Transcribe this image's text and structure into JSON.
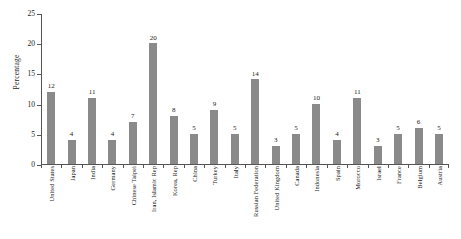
{
  "chart_data": {
    "type": "bar",
    "title": "",
    "subtitle": "",
    "xlabel": "",
    "ylabel": "Percentage",
    "ylim": [
      0,
      25
    ],
    "yticks": [
      0,
      5,
      10,
      15,
      20,
      25
    ],
    "grid": false,
    "legend": false,
    "legend_position": "none",
    "bar_color": "#8a8a8a",
    "axis_color": "#555555",
    "value_labels_shown": true,
    "categories": [
      "United States",
      "Japan",
      "India",
      "Germany",
      "Chinese Taipei",
      "Iran, Islamic Rep",
      "Korea, Rep",
      "China",
      "Turkey",
      "Italy",
      "Russian Federation",
      "United Kingdom",
      "Canada",
      "Indonesia",
      "Spain",
      "Morocco",
      "Israel",
      "France",
      "Belgium",
      "Austria"
    ],
    "values": [
      12,
      4,
      11,
      4,
      7,
      20,
      8,
      5,
      9,
      5,
      14,
      3,
      5,
      10,
      4,
      11,
      3,
      5,
      6,
      5
    ]
  }
}
